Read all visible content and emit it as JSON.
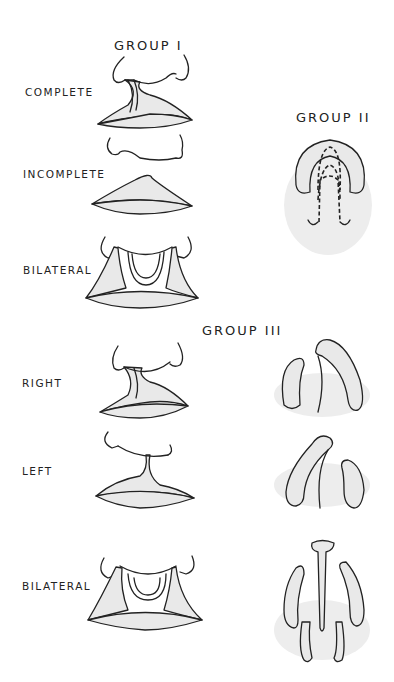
{
  "groups": [
    {
      "id": "group-1",
      "title": "GROUP I",
      "items": [
        {
          "label": "COMPLETE"
        },
        {
          "label": "INCOMPLETE"
        },
        {
          "label": "BILATERAL"
        }
      ]
    },
    {
      "id": "group-2",
      "title": "GROUP II",
      "items": []
    },
    {
      "id": "group-3",
      "title": "GROUP III",
      "items": [
        {
          "label": "RIGHT"
        },
        {
          "label": "LEFT"
        },
        {
          "label": "BILATERAL"
        }
      ]
    }
  ],
  "colors": {
    "line": "#222222",
    "fill": "#e9e9e9",
    "background": "#ffffff"
  }
}
